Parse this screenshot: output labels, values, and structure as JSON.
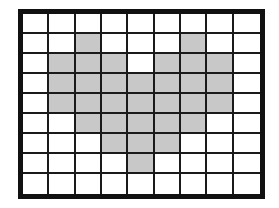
{
  "diagram": {
    "type": "grid-shading",
    "rows": 9,
    "cols": 9,
    "shape": "heart",
    "colors": {
      "border": "#111111",
      "line": "#1a1a1a",
      "filled": "#c8c8c8",
      "empty": "#ffffff"
    },
    "filled_cells": [
      [
        1,
        2
      ],
      [
        1,
        6
      ],
      [
        2,
        1
      ],
      [
        2,
        2
      ],
      [
        2,
        3
      ],
      [
        2,
        5
      ],
      [
        2,
        6
      ],
      [
        2,
        7
      ],
      [
        3,
        1
      ],
      [
        3,
        2
      ],
      [
        3,
        3
      ],
      [
        3,
        4
      ],
      [
        3,
        5
      ],
      [
        3,
        6
      ],
      [
        3,
        7
      ],
      [
        4,
        1
      ],
      [
        4,
        2
      ],
      [
        4,
        3
      ],
      [
        4,
        4
      ],
      [
        4,
        5
      ],
      [
        4,
        6
      ],
      [
        4,
        7
      ],
      [
        5,
        2
      ],
      [
        5,
        3
      ],
      [
        5,
        4
      ],
      [
        5,
        5
      ],
      [
        5,
        6
      ],
      [
        6,
        3
      ],
      [
        6,
        4
      ],
      [
        6,
        5
      ],
      [
        7,
        4
      ]
    ],
    "filled_count": 31,
    "total_cells": 81
  }
}
